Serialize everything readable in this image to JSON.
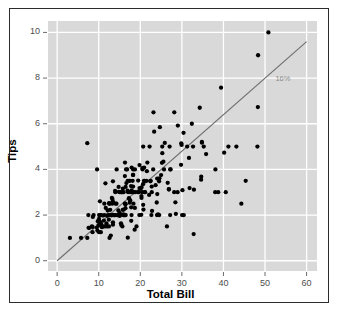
{
  "chart_data": {
    "type": "scatter",
    "title": "",
    "xlabel": "Total Bill",
    "ylabel": "Tips",
    "xlim": [
      -2.2,
      62.5
    ],
    "ylim": [
      -0.45,
      10.5
    ],
    "xticks": [
      0,
      10,
      20,
      30,
      40,
      50,
      60
    ],
    "yticks": [
      0,
      2,
      4,
      6,
      8,
      10
    ],
    "xtick_labels": [
      "0",
      "10",
      "20",
      "30",
      "40",
      "50",
      "60"
    ],
    "ytick_labels": [
      "0",
      "2",
      "4",
      "6",
      "8",
      "10"
    ],
    "grid": true,
    "grid_color": "#ffffff",
    "panel_background": "#d9d9d9",
    "point_color": "#000000",
    "point_size": 3.1,
    "legend": "none",
    "annotations": [
      {
        "text": "16%",
        "x": 52.5,
        "y": 7.95,
        "color": "#8a8a8a"
      }
    ],
    "reference_line": {
      "label": "16%",
      "slope": 0.16,
      "intercept": 0,
      "x_start": 0,
      "y_start": 0,
      "x_end": 60,
      "y_end": 9.6,
      "color": "#6e6e6e",
      "width": 1.1
    },
    "points": [
      [
        16.99,
        1.01
      ],
      [
        10.34,
        1.66
      ],
      [
        21.01,
        3.5
      ],
      [
        23.68,
        3.31
      ],
      [
        24.59,
        3.61
      ],
      [
        25.29,
        4.71
      ],
      [
        8.77,
        2.0
      ],
      [
        26.88,
        3.12
      ],
      [
        15.04,
        1.96
      ],
      [
        14.78,
        3.23
      ],
      [
        10.27,
        1.71
      ],
      [
        35.26,
        5.0
      ],
      [
        15.42,
        1.57
      ],
      [
        18.43,
        3.0
      ],
      [
        14.83,
        3.02
      ],
      [
        21.58,
        3.92
      ],
      [
        10.33,
        1.67
      ],
      [
        16.29,
        3.71
      ],
      [
        16.97,
        3.5
      ],
      [
        20.65,
        3.35
      ],
      [
        17.92,
        4.08
      ],
      [
        20.29,
        2.75
      ],
      [
        15.77,
        2.23
      ],
      [
        39.42,
        7.58
      ],
      [
        19.82,
        3.18
      ],
      [
        17.81,
        2.34
      ],
      [
        13.37,
        2.0
      ],
      [
        12.69,
        2.0
      ],
      [
        21.7,
        4.3
      ],
      [
        19.65,
        3.0
      ],
      [
        9.55,
        1.45
      ],
      [
        18.35,
        2.5
      ],
      [
        15.06,
        3.0
      ],
      [
        20.69,
        2.45
      ],
      [
        17.78,
        3.27
      ],
      [
        24.06,
        3.6
      ],
      [
        16.31,
        2.0
      ],
      [
        16.93,
        3.07
      ],
      [
        18.69,
        2.31
      ],
      [
        31.27,
        5.0
      ],
      [
        16.04,
        2.24
      ],
      [
        17.46,
        2.54
      ],
      [
        13.94,
        3.06
      ],
      [
        9.68,
        1.32
      ],
      [
        30.4,
        5.6
      ],
      [
        18.29,
        3.0
      ],
      [
        22.23,
        5.0
      ],
      [
        32.4,
        6.0
      ],
      [
        28.55,
        2.05
      ],
      [
        18.04,
        3.0
      ],
      [
        12.54,
        2.5
      ],
      [
        10.29,
        2.6
      ],
      [
        34.81,
        5.2
      ],
      [
        9.94,
        1.56
      ],
      [
        25.56,
        4.34
      ],
      [
        19.49,
        3.51
      ],
      [
        38.01,
        3.0
      ],
      [
        26.41,
        1.5
      ],
      [
        11.24,
        1.76
      ],
      [
        48.27,
        6.73
      ],
      [
        20.29,
        3.21
      ],
      [
        13.81,
        2.0
      ],
      [
        11.02,
        1.98
      ],
      [
        18.29,
        3.76
      ],
      [
        17.59,
        2.64
      ],
      [
        20.08,
        3.15
      ],
      [
        16.45,
        2.47
      ],
      [
        3.07,
        1.0
      ],
      [
        20.23,
        2.01
      ],
      [
        15.01,
        2.09
      ],
      [
        12.02,
        1.97
      ],
      [
        17.07,
        3.0
      ],
      [
        26.86,
        3.14
      ],
      [
        25.28,
        5.0
      ],
      [
        14.73,
        2.2
      ],
      [
        10.51,
        1.25
      ],
      [
        17.92,
        3.08
      ],
      [
        27.2,
        4.0
      ],
      [
        22.76,
        3.0
      ],
      [
        17.29,
        2.71
      ],
      [
        19.44,
        3.0
      ],
      [
        16.66,
        3.4
      ],
      [
        10.07,
        1.83
      ],
      [
        32.68,
        5.0
      ],
      [
        15.98,
        2.03
      ],
      [
        34.83,
        5.17
      ],
      [
        13.03,
        2.0
      ],
      [
        18.28,
        4.0
      ],
      [
        24.71,
        5.85
      ],
      [
        21.16,
        3.0
      ],
      [
        28.97,
        3.0
      ],
      [
        22.49,
        3.5
      ],
      [
        5.75,
        1.0
      ],
      [
        16.32,
        4.3
      ],
      [
        22.75,
        3.25
      ],
      [
        40.17,
        4.73
      ],
      [
        27.28,
        4.0
      ],
      [
        12.03,
        1.5
      ],
      [
        21.01,
        3.0
      ],
      [
        12.46,
        1.5
      ],
      [
        11.35,
        2.5
      ],
      [
        15.38,
        3.0
      ],
      [
        44.3,
        2.5
      ],
      [
        22.42,
        3.48
      ],
      [
        20.92,
        4.08
      ],
      [
        15.36,
        1.64
      ],
      [
        20.49,
        4.06
      ],
      [
        25.21,
        4.29
      ],
      [
        18.24,
        3.76
      ],
      [
        14.31,
        4.0
      ],
      [
        14.0,
        3.0
      ],
      [
        7.25,
        1.0
      ],
      [
        38.07,
        4.0
      ],
      [
        23.95,
        2.55
      ],
      [
        25.71,
        4.0
      ],
      [
        17.31,
        3.5
      ],
      [
        29.93,
        5.07
      ],
      [
        10.65,
        1.5
      ],
      [
        12.43,
        1.8
      ],
      [
        24.08,
        2.92
      ],
      [
        11.69,
        2.31
      ],
      [
        13.42,
        1.68
      ],
      [
        14.26,
        2.5
      ],
      [
        15.95,
        2.0
      ],
      [
        12.48,
        2.52
      ],
      [
        29.8,
        4.2
      ],
      [
        8.52,
        1.48
      ],
      [
        14.52,
        2.0
      ],
      [
        11.38,
        2.0
      ],
      [
        22.82,
        2.18
      ],
      [
        19.08,
        1.5
      ],
      [
        20.27,
        2.83
      ],
      [
        11.17,
        1.5
      ],
      [
        12.26,
        2.0
      ],
      [
        18.26,
        3.25
      ],
      [
        8.51,
        1.25
      ],
      [
        10.33,
        2.0
      ],
      [
        14.15,
        2.0
      ],
      [
        16.0,
        2.0
      ],
      [
        13.16,
        2.75
      ],
      [
        17.47,
        3.5
      ],
      [
        34.3,
        6.7
      ],
      [
        41.19,
        5.0
      ],
      [
        27.05,
        5.0
      ],
      [
        16.43,
        2.3
      ],
      [
        8.35,
        1.5
      ],
      [
        18.64,
        1.36
      ],
      [
        11.87,
        1.63
      ],
      [
        9.78,
        1.73
      ],
      [
        7.51,
        2.0
      ],
      [
        14.07,
        2.5
      ],
      [
        13.13,
        2.0
      ],
      [
        17.26,
        2.74
      ],
      [
        24.55,
        2.0
      ],
      [
        19.77,
        2.0
      ],
      [
        29.85,
        5.14
      ],
      [
        48.17,
        5.0
      ],
      [
        25.0,
        3.75
      ],
      [
        13.39,
        2.61
      ],
      [
        16.49,
        2.0
      ],
      [
        21.5,
        3.5
      ],
      [
        12.66,
        2.5
      ],
      [
        16.21,
        2.0
      ],
      [
        13.81,
        2.0
      ],
      [
        17.51,
        3.0
      ],
      [
        24.52,
        3.48
      ],
      [
        20.76,
        2.24
      ],
      [
        31.71,
        4.5
      ],
      [
        10.59,
        1.61
      ],
      [
        10.63,
        2.0
      ],
      [
        50.81,
        10.0
      ],
      [
        15.81,
        3.16
      ],
      [
        7.25,
        5.15
      ],
      [
        31.85,
        3.18
      ],
      [
        16.82,
        4.0
      ],
      [
        32.9,
        3.11
      ],
      [
        17.89,
        2.0
      ],
      [
        14.48,
        2.0
      ],
      [
        9.6,
        4.0
      ],
      [
        34.63,
        3.55
      ],
      [
        34.65,
        3.68
      ],
      [
        23.33,
        5.65
      ],
      [
        45.35,
        3.5
      ],
      [
        23.17,
        6.5
      ],
      [
        40.55,
        3.0
      ],
      [
        20.69,
        5.0
      ],
      [
        20.9,
        3.5
      ],
      [
        30.46,
        2.0
      ],
      [
        18.15,
        3.5
      ],
      [
        23.1,
        4.0
      ],
      [
        15.69,
        1.5
      ],
      [
        19.81,
        4.19
      ],
      [
        28.44,
        2.56
      ],
      [
        15.48,
        2.02
      ],
      [
        16.58,
        4.0
      ],
      [
        7.56,
        1.44
      ],
      [
        10.34,
        2.0
      ],
      [
        43.11,
        5.0
      ],
      [
        13.0,
        2.0
      ],
      [
        13.51,
        2.0
      ],
      [
        18.71,
        4.0
      ],
      [
        12.74,
        2.01
      ],
      [
        13.0,
        2.0
      ],
      [
        16.4,
        2.5
      ],
      [
        20.53,
        4.0
      ],
      [
        16.47,
        3.23
      ],
      [
        26.59,
        3.41
      ],
      [
        38.73,
        3.0
      ],
      [
        24.27,
        2.03
      ],
      [
        12.76,
        2.23
      ],
      [
        30.06,
        2.0
      ],
      [
        25.89,
        5.16
      ],
      [
        48.33,
        9.0
      ],
      [
        13.27,
        2.5
      ],
      [
        28.17,
        6.5
      ],
      [
        12.9,
        1.1
      ],
      [
        28.15,
        3.0
      ],
      [
        11.59,
        1.5
      ],
      [
        7.74,
        1.44
      ],
      [
        30.14,
        3.09
      ],
      [
        12.16,
        2.2
      ],
      [
        13.42,
        3.48
      ],
      [
        8.58,
        1.92
      ],
      [
        15.98,
        3.0
      ],
      [
        13.42,
        1.58
      ],
      [
        16.27,
        2.5
      ],
      [
        10.09,
        2.0
      ],
      [
        20.45,
        3.0
      ],
      [
        13.28,
        2.72
      ],
      [
        22.12,
        2.88
      ],
      [
        24.01,
        2.0
      ],
      [
        15.69,
        3.0
      ],
      [
        11.61,
        3.39
      ],
      [
        10.77,
        1.47
      ],
      [
        15.53,
        3.0
      ],
      [
        10.07,
        1.25
      ],
      [
        12.6,
        1.0
      ],
      [
        32.83,
        1.17
      ],
      [
        35.83,
        4.67
      ],
      [
        29.03,
        5.92
      ],
      [
        27.18,
        2.0
      ],
      [
        22.67,
        2.0
      ],
      [
        17.82,
        1.75
      ],
      [
        18.78,
        3.0
      ]
    ]
  }
}
